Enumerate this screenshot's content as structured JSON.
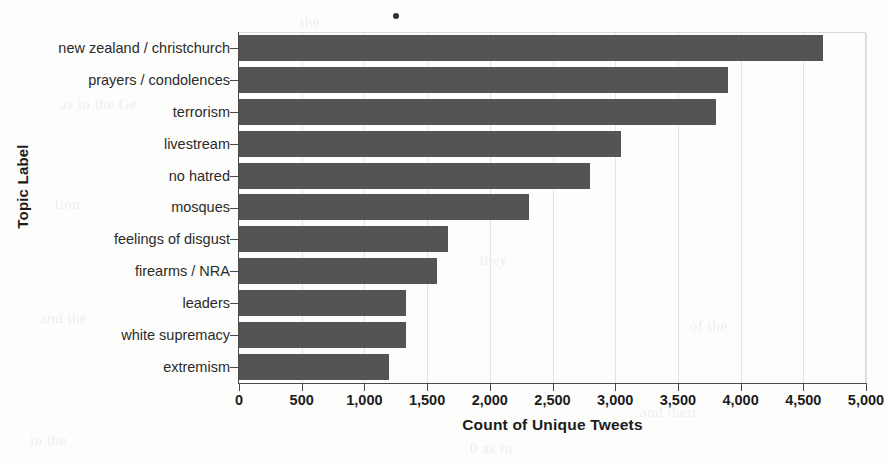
{
  "chart_data": {
    "type": "bar",
    "orientation": "horizontal",
    "title": "",
    "xlabel": "Count of Unique Tweets",
    "ylabel": "Topic Label",
    "xlim": [
      0,
      5000
    ],
    "grid": "vertical",
    "legend": "none",
    "bar_color": "#545454",
    "categories": [
      "new zealand / christchurch",
      "prayers / condolences",
      "terrorism",
      "livestream",
      "no hatred",
      "mosques",
      "feelings of disgust",
      "firearms / NRA",
      "leaders",
      "white supremacy",
      "extremism"
    ],
    "values": [
      4660,
      3900,
      3800,
      3050,
      2800,
      2310,
      1670,
      1580,
      1330,
      1330,
      1200
    ],
    "xticks": [
      0,
      500,
      1000,
      1500,
      2000,
      2500,
      3000,
      3500,
      4000,
      4500,
      5000
    ],
    "xtick_labels": [
      "0",
      "500",
      "1,000",
      "1,500",
      "2,000",
      "2,500",
      "3,000",
      "3,500",
      "4,000",
      "4,500",
      "5,000"
    ]
  },
  "artifacts": {
    "speck": "scan-speck",
    "bleed_text": [
      "as in the Ge",
      "the",
      "is of",
      "tion",
      "they",
      "and the",
      "of the",
      "in the",
      "0 as in",
      "to as O",
      "and their"
    ]
  }
}
